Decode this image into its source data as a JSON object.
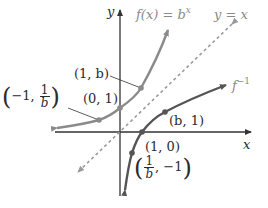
{
  "diagram": {
    "axes": {
      "x_label": "x",
      "y_label": "y"
    },
    "curves": {
      "exp": {
        "label_prefix": "f(x) = b",
        "label_exp": "x",
        "color": "#8a8a8a"
      },
      "inverse": {
        "label_base": "f",
        "label_exp": "−1",
        "color": "#555555"
      },
      "identity": {
        "label": "y = x",
        "color": "#9a9a9a",
        "style": "dashed"
      }
    },
    "points": {
      "p_1_b": "(1, b)",
      "p_0_1": "(0, 1)",
      "p_neg1_1overb": {
        "open": "(",
        "x": "−1, ",
        "num": "1",
        "den": "b",
        "close": ")"
      },
      "p_b_1": "(b, 1)",
      "p_1_0": "(1, 0)",
      "p_1overb_neg1": {
        "open": "(",
        "num": "1",
        "den": "b",
        "y": ", −1",
        "close": ")"
      }
    }
  }
}
